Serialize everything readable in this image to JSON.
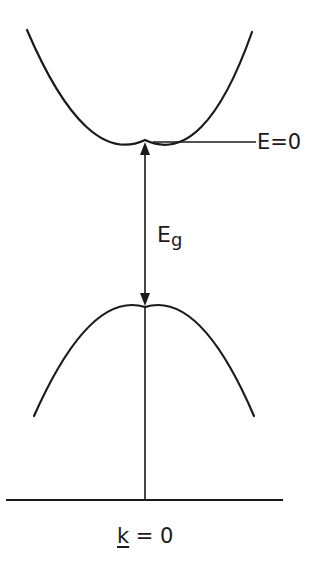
{
  "diagram": {
    "type": "band-structure",
    "colors": {
      "ink": "#1a1a1a",
      "background": "#ffffff"
    },
    "conduction_band": {
      "shape": "upward parabola",
      "left_end": [
        27,
        30
      ],
      "minimum": [
        145,
        140
      ],
      "right_end": [
        252,
        32
      ]
    },
    "valence_band": {
      "shape": "downward parabola",
      "left_end": [
        34,
        416
      ],
      "maximum": [
        145,
        307
      ],
      "right_end": [
        254,
        416
      ]
    },
    "energy_reference": {
      "label": "E=0",
      "line_from_x": 153,
      "line_to_x": 256,
      "y": 142
    },
    "gap": {
      "label_main": "E",
      "label_sub": "g",
      "arrow": "double-headed vertical",
      "from_y": 142,
      "to_y": 306
    },
    "k_axis": {
      "label_symbol": "k",
      "label_rest": " = 0",
      "baseline_y": 500,
      "baseline_from_x": 6,
      "baseline_to_x": 283,
      "vertical_line_x": 145
    }
  }
}
